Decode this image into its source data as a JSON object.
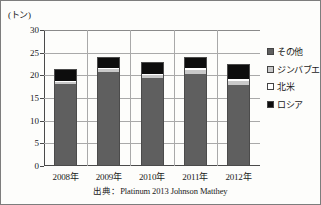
{
  "chart_data": {
    "type": "bar",
    "subtype": "stacked",
    "title": "",
    "xlabel": "",
    "ylabel": "(トン)",
    "y_unit": "(トン)",
    "categories": [
      "2008年",
      "2009年",
      "2010年",
      "2011年",
      "2012年"
    ],
    "yticks": [
      0,
      5,
      10,
      15,
      20,
      25,
      30
    ],
    "ylim": [
      0,
      30
    ],
    "grid": true,
    "legend_position": "right",
    "series": [
      {
        "name": "ロシア",
        "color": "#0d0d0d",
        "values": [
          2.7,
          2.5,
          2.6,
          2.4,
          3.3
        ]
      },
      {
        "name": "北米",
        "color": "#ffffff",
        "values": [
          0.3,
          0.3,
          0.3,
          0.4,
          0.4
        ]
      },
      {
        "name": "ジンバブエ",
        "color": "#c9c9c9",
        "values": [
          0.5,
          0.5,
          0.6,
          0.8,
          0.9
        ]
      },
      {
        "name": "その他",
        "color": "#5f5f5f",
        "values": [
          18.0,
          20.8,
          19.5,
          20.4,
          17.9
        ]
      }
    ],
    "totals": [
      21.5,
      24.1,
      23.0,
      24.0,
      22.5
    ],
    "annotations": [
      "出典：Platinum 2013 Johnson Matthey"
    ]
  },
  "legend": {
    "items": [
      {
        "label": "その他",
        "swatch": "#5f5f5f"
      },
      {
        "label": "ジンバブエ",
        "swatch": "#c9c9c9"
      },
      {
        "label": "北米",
        "swatch": "#ffffff"
      },
      {
        "label": "ロシア",
        "swatch": "#0d0d0d"
      }
    ]
  },
  "source": {
    "text": "出典：Platinum 2013 Johnson Matthey"
  }
}
